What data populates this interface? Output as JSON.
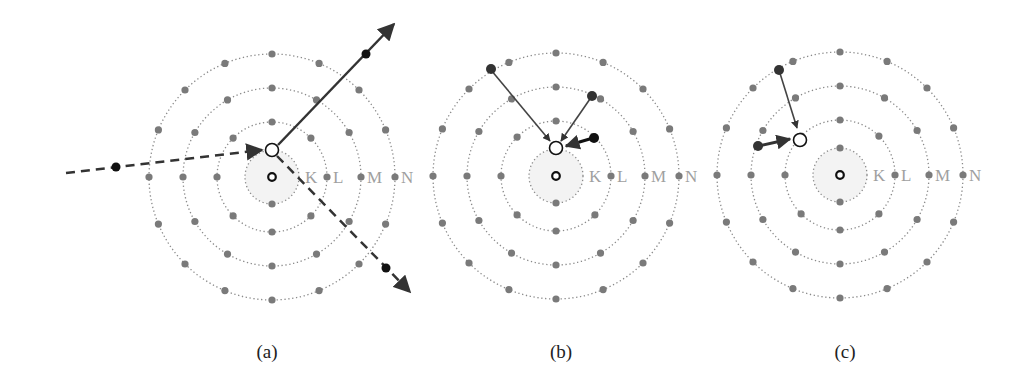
{
  "figure": {
    "panels": [
      {
        "id": "a",
        "caption": "(a)",
        "center": [
          272,
          177
        ],
        "shell_labels": [
          "K",
          "L",
          "M",
          "N"
        ]
      },
      {
        "id": "b",
        "caption": "(b)",
        "center": [
          556,
          176
        ],
        "shell_labels": [
          "K",
          "L",
          "M",
          "N"
        ]
      },
      {
        "id": "c",
        "caption": "(c)",
        "center": [
          840,
          175
        ],
        "shell_labels": [
          "K",
          "L",
          "M",
          "N"
        ]
      }
    ],
    "shells": [
      {
        "name": "K",
        "radius": 27,
        "electrons": 2
      },
      {
        "name": "L",
        "radius": 55,
        "electrons": 8
      },
      {
        "name": "M",
        "radius": 89,
        "electrons": 12
      },
      {
        "name": "N",
        "radius": 123,
        "electrons": 16
      }
    ],
    "colors": {
      "electron": "#7a7a7a",
      "orbit": "#8a8a8a",
      "label": "#a0a0a0",
      "arrow": "#333333",
      "vacancy": "#ffffff"
    }
  }
}
